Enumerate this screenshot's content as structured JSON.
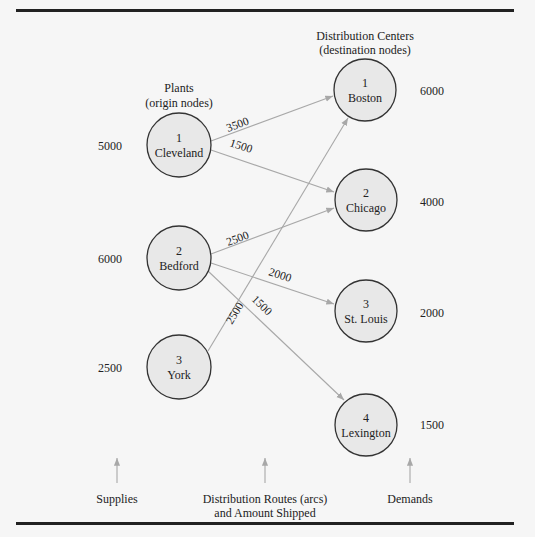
{
  "headers": {
    "plants": [
      "Plants",
      "(origin nodes)"
    ],
    "distribution_centers": [
      "Distribution Centers",
      "(destination nodes)"
    ]
  },
  "origins": [
    {
      "id": "1",
      "name": "Cleveland",
      "supply": "5000",
      "cx": 179,
      "cy": 145
    },
    {
      "id": "2",
      "name": "Bedford",
      "supply": "6000",
      "cx": 179,
      "cy": 258
    },
    {
      "id": "3",
      "name": "York",
      "supply": "2500",
      "cx": 179,
      "cy": 367
    }
  ],
  "destinations": [
    {
      "id": "1",
      "name": "Boston",
      "demand": "6000",
      "cx": 365,
      "cy": 90
    },
    {
      "id": "2",
      "name": "Chicago",
      "demand": "4000",
      "cx": 366,
      "cy": 200
    },
    {
      "id": "3",
      "name": "St. Louis",
      "demand": "2000",
      "cx": 366,
      "cy": 311
    },
    {
      "id": "4",
      "name": "Lexington",
      "demand": "1500",
      "cx": 366,
      "cy": 425
    }
  ],
  "arcs": [
    {
      "from": "Cleveland",
      "to": "Boston",
      "amount": "3500"
    },
    {
      "from": "Cleveland",
      "to": "Chicago",
      "amount": "1500"
    },
    {
      "from": "Bedford",
      "to": "Chicago",
      "amount": "2500"
    },
    {
      "from": "Bedford",
      "to": "St. Louis",
      "amount": "2000"
    },
    {
      "from": "Bedford",
      "to": "Lexington",
      "amount": "1500"
    },
    {
      "from": "York",
      "to": "Boston",
      "amount": "2500"
    }
  ],
  "footer": {
    "supplies": "Supplies",
    "routes": [
      "Distribution Routes (arcs)",
      "and Amount Shipped"
    ],
    "demands": "Demands"
  },
  "colors": {
    "node_fill": "#e8e8e8",
    "node_stroke": "#333333",
    "arc": "#a8a8a8",
    "rule": "#222222"
  }
}
